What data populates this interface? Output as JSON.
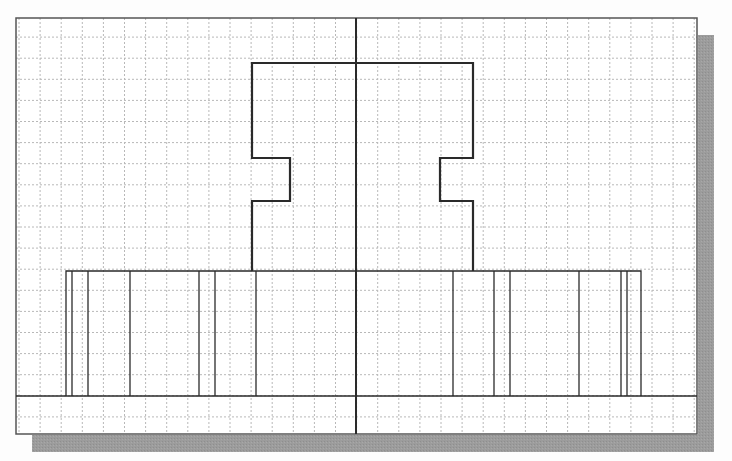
{
  "drawing": {
    "type": "2D CAD sketch on grid (front view of symmetric part)",
    "colors": {
      "background": "#fdfdfd",
      "paper": "#ffffff",
      "grid": "#b8b8b8",
      "frame": "#555555",
      "object_line": "#2a2a2a",
      "shadow": "#9c9c9c"
    },
    "frame": {
      "x": 16,
      "y": 18,
      "width": 681,
      "height": 416
    },
    "shadow": {
      "offset_x": 16,
      "offset_y": 17
    },
    "grid": {
      "spacing": 21.1,
      "origin_x": 19,
      "origin_y": 16
    },
    "center_line": {
      "x": 356,
      "y1": 18,
      "y2": 434
    },
    "base_line": {
      "y": 396,
      "x1": 16,
      "x2": 697
    },
    "upper_profile": {
      "points": [
        [
          252,
          271
        ],
        [
          252,
          63
        ],
        [
          473,
          63
        ],
        [
          473,
          158
        ],
        [
          440,
          158
        ],
        [
          440,
          201
        ],
        [
          473,
          201
        ],
        [
          473,
          271
        ]
      ],
      "left_points": [
        [
          252,
          271
        ],
        [
          252,
          201
        ],
        [
          290,
          201
        ],
        [
          290,
          158
        ],
        [
          252,
          158
        ],
        [
          252,
          63
        ],
        [
          356,
          63
        ]
      ],
      "description": "Symmetric upper body with notches on both sides"
    },
    "lower_block": {
      "x1": 66,
      "x2": 641,
      "y_top": 271,
      "y_bottom": 396,
      "vertical_lines_x": [
        72,
        88,
        130,
        199,
        215,
        256,
        453,
        494,
        510,
        579,
        621,
        627
      ]
    }
  }
}
